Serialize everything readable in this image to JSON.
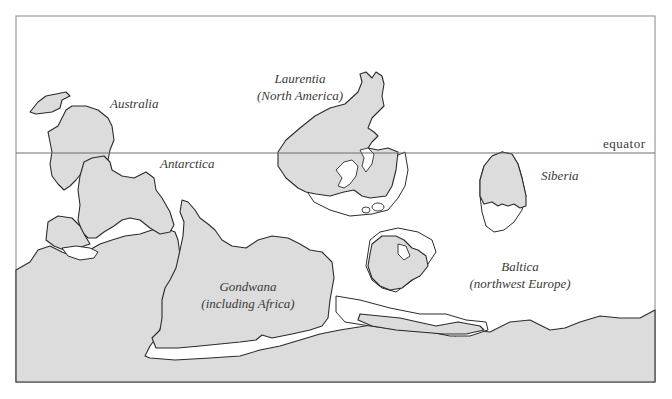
{
  "map": {
    "type": "paleogeographic reconstruction",
    "equator_label": "equator",
    "colors": {
      "land": "#dcdcdc",
      "outline": "#2b2b2b",
      "frame": "#9a9a9a",
      "text": "#3a3a3a",
      "background": "#ffffff"
    },
    "labels": {
      "australia": "Australia",
      "antarctica": "Antarctica",
      "laurentia_line1": "Laurentia",
      "laurentia_line2": "(North America)",
      "siberia": "Siberia",
      "baltica_line1": "Baltica",
      "baltica_line2": "(northwest Europe)",
      "gondwana_line1": "Gondwana",
      "gondwana_line2": "(including Africa)"
    }
  }
}
